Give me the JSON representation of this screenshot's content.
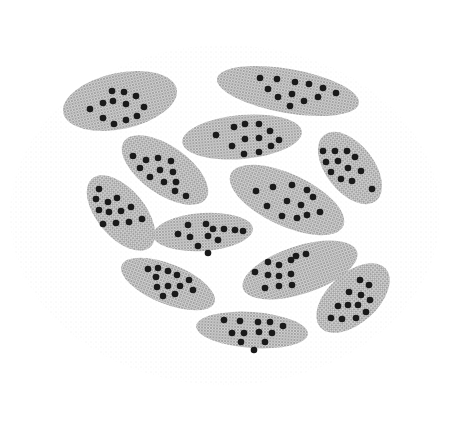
{
  "image": {
    "description": "Stippled halftone illustration of twelve grey elliptical cells, each containing dark round dots",
    "width": 450,
    "height": 429,
    "background": "#ffffff",
    "cell_fill": "#bdbdbd",
    "dot_fill": "#1a1a1a"
  },
  "cells": [
    {
      "cx": 120,
      "cy": 101,
      "rx": 58,
      "ry": 28,
      "rot": -12,
      "dots": [
        [
          112,
          91
        ],
        [
          124,
          92
        ],
        [
          136,
          96
        ],
        [
          103,
          103
        ],
        [
          113,
          101
        ],
        [
          126,
          104
        ],
        [
          144,
          107
        ],
        [
          90,
          109
        ],
        [
          103,
          118
        ],
        [
          126,
          120
        ],
        [
          137,
          116
        ],
        [
          114,
          124
        ]
      ]
    },
    {
      "cx": 288,
      "cy": 91,
      "rx": 72,
      "ry": 22,
      "rot": 10,
      "dots": [
        [
          260,
          78
        ],
        [
          277,
          79
        ],
        [
          295,
          82
        ],
        [
          309,
          84
        ],
        [
          323,
          88
        ],
        [
          336,
          93
        ],
        [
          268,
          89
        ],
        [
          292,
          94
        ],
        [
          318,
          97
        ],
        [
          278,
          97
        ],
        [
          304,
          101
        ],
        [
          290,
          106
        ]
      ]
    },
    {
      "cx": 242,
      "cy": 137,
      "rx": 60,
      "ry": 22,
      "rot": -5,
      "dots": [
        [
          216,
          135
        ],
        [
          234,
          127
        ],
        [
          245,
          124
        ],
        [
          259,
          124
        ],
        [
          270,
          131
        ],
        [
          279,
          140
        ],
        [
          245,
          139
        ],
        [
          259,
          138
        ],
        [
          232,
          146
        ],
        [
          271,
          146
        ],
        [
          244,
          154
        ],
        [
          259,
          152
        ]
      ]
    },
    {
      "cx": 350,
      "cy": 168,
      "rx": 42,
      "ry": 24,
      "rot": 52,
      "dots": [
        [
          323,
          151
        ],
        [
          335,
          151
        ],
        [
          347,
          151
        ],
        [
          326,
          162
        ],
        [
          338,
          161
        ],
        [
          355,
          157
        ],
        [
          331,
          172
        ],
        [
          348,
          168
        ],
        [
          361,
          171
        ],
        [
          341,
          179
        ],
        [
          352,
          181
        ],
        [
          372,
          189
        ]
      ]
    },
    {
      "cx": 165,
      "cy": 170,
      "rx": 50,
      "ry": 24,
      "rot": 35,
      "dots": [
        [
          133,
          156
        ],
        [
          146,
          160
        ],
        [
          158,
          158
        ],
        [
          171,
          161
        ],
        [
          140,
          168
        ],
        [
          160,
          170
        ],
        [
          173,
          172
        ],
        [
          150,
          177
        ],
        [
          164,
          182
        ],
        [
          176,
          182
        ],
        [
          175,
          191
        ],
        [
          186,
          196
        ]
      ]
    },
    {
      "cx": 287,
      "cy": 200,
      "rx": 62,
      "ry": 26,
      "rot": 25,
      "dots": [
        [
          256,
          191
        ],
        [
          273,
          187
        ],
        [
          292,
          185
        ],
        [
          307,
          190
        ],
        [
          313,
          197
        ],
        [
          267,
          206
        ],
        [
          287,
          201
        ],
        [
          301,
          205
        ],
        [
          282,
          216
        ],
        [
          297,
          218
        ],
        [
          307,
          215
        ],
        [
          320,
          212
        ]
      ]
    },
    {
      "cx": 121,
      "cy": 213,
      "rx": 45,
      "ry": 24,
      "rot": 50,
      "dots": [
        [
          99,
          189
        ],
        [
          96,
          199
        ],
        [
          108,
          202
        ],
        [
          117,
          198
        ],
        [
          99,
          210
        ],
        [
          109,
          212
        ],
        [
          121,
          211
        ],
        [
          131,
          207
        ],
        [
          103,
          224
        ],
        [
          116,
          223
        ],
        [
          129,
          222
        ],
        [
          142,
          219
        ]
      ]
    },
    {
      "cx": 203,
      "cy": 232,
      "rx": 50,
      "ry": 19,
      "rot": -4,
      "dots": [
        [
          188,
          225
        ],
        [
          206,
          224
        ],
        [
          213,
          229
        ],
        [
          224,
          229
        ],
        [
          235,
          230
        ],
        [
          243,
          231
        ],
        [
          178,
          234
        ],
        [
          190,
          237
        ],
        [
          208,
          236
        ],
        [
          218,
          240
        ],
        [
          198,
          246
        ],
        [
          208,
          253
        ]
      ]
    },
    {
      "cx": 168,
      "cy": 284,
      "rx": 50,
      "ry": 20,
      "rot": 22,
      "dots": [
        [
          148,
          269
        ],
        [
          158,
          268
        ],
        [
          168,
          271
        ],
        [
          177,
          275
        ],
        [
          156,
          277
        ],
        [
          189,
          280
        ],
        [
          157,
          287
        ],
        [
          168,
          286
        ],
        [
          180,
          286
        ],
        [
          193,
          290
        ],
        [
          163,
          296
        ],
        [
          175,
          294
        ]
      ]
    },
    {
      "cx": 300,
      "cy": 270,
      "rx": 60,
      "ry": 24,
      "rot": -18,
      "dots": [
        [
          268,
          262
        ],
        [
          279,
          265
        ],
        [
          291,
          260
        ],
        [
          296,
          256
        ],
        [
          306,
          254
        ],
        [
          255,
          272
        ],
        [
          268,
          275
        ],
        [
          279,
          276
        ],
        [
          291,
          274
        ],
        [
          265,
          288
        ],
        [
          279,
          286
        ],
        [
          292,
          285
        ]
      ]
    },
    {
      "cx": 353,
      "cy": 298,
      "rx": 44,
      "ry": 25,
      "rot": -42,
      "dots": [
        [
          360,
          280
        ],
        [
          369,
          285
        ],
        [
          349,
          292
        ],
        [
          361,
          295
        ],
        [
          370,
          300
        ],
        [
          338,
          306
        ],
        [
          348,
          305
        ],
        [
          358,
          305
        ],
        [
          366,
          312
        ],
        [
          331,
          318
        ],
        [
          342,
          319
        ],
        [
          356,
          318
        ]
      ]
    },
    {
      "cx": 252,
      "cy": 330,
      "rx": 56,
      "ry": 18,
      "rot": 4,
      "dots": [
        [
          224,
          320
        ],
        [
          240,
          321
        ],
        [
          258,
          322
        ],
        [
          270,
          322
        ],
        [
          283,
          326
        ],
        [
          232,
          333
        ],
        [
          244,
          333
        ],
        [
          259,
          332
        ],
        [
          272,
          333
        ],
        [
          241,
          342
        ],
        [
          265,
          342
        ],
        [
          254,
          350
        ]
      ]
    }
  ]
}
